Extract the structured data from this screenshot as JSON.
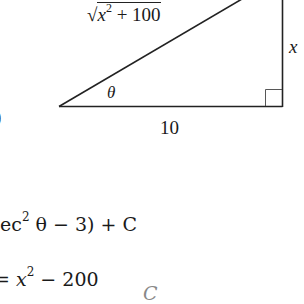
{
  "figure": {
    "type": "right-triangle",
    "hypotenuse_label": {
      "radical": "√",
      "base": "x",
      "exp": "2",
      "rest": " + 100"
    },
    "vertical_leg_label": "x",
    "horizontal_leg_label": "10",
    "angle_label": "θ",
    "right_angle_marker": true
  },
  "left_edge_fragment": ")",
  "equations": {
    "line1": {
      "prefix": "ec",
      "exp": "2",
      "after": " θ − 3) + C"
    },
    "line2": {
      "prefix": "= ",
      "var": "x",
      "exp": "2",
      "after": " − 200",
      "trail": "C"
    }
  },
  "colors": {
    "ink": "#1a1a1a",
    "background": "#ffffff"
  }
}
